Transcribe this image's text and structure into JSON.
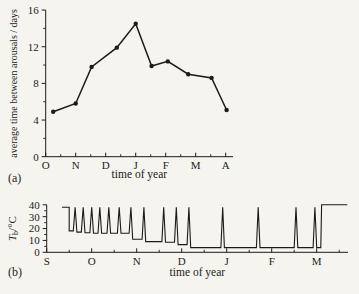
{
  "colors": {
    "ink": "#1b1b1b",
    "background": "#f6f4ef"
  },
  "panels": {
    "a": {
      "label": "(a)"
    },
    "b": {
      "label": "(b)"
    }
  },
  "chart_data": [
    {
      "panel": "a",
      "type": "line",
      "title": "",
      "xlabel": "time of year",
      "ylabel": "average time between arousals / days",
      "x_tick_labels": [
        "O",
        "N",
        "D",
        "J",
        "F",
        "M",
        "A"
      ],
      "y_major_ticks": [
        0,
        4,
        8,
        12,
        16
      ],
      "y_minor_ticks": [
        2,
        6,
        10,
        14
      ],
      "ylim": [
        0,
        16
      ],
      "grid": false,
      "legend": "none",
      "marker": "filled-circle",
      "series": [
        {
          "name": "average time between arousals",
          "x": [
            0.25,
            1.0,
            1.53,
            2.37,
            3.0,
            3.53,
            4.07,
            4.75,
            5.53,
            6.03
          ],
          "y": [
            4.9,
            5.8,
            9.8,
            11.9,
            14.5,
            9.9,
            10.4,
            9.0,
            8.6,
            5.1
          ]
        }
      ]
    },
    {
      "panel": "b",
      "type": "line",
      "title": "",
      "xlabel": "time of year",
      "ylabel": "Tb/°C",
      "ylabel_parts": {
        "lead": "T",
        "sub": "b",
        "rest": "/°C"
      },
      "x_tick_labels": [
        "S",
        "O",
        "N",
        "D",
        "J",
        "F",
        "M"
      ],
      "y_major_ticks": [
        0,
        10,
        20,
        30,
        40
      ],
      "y_minor_ticks": [
        5,
        15,
        25,
        35
      ],
      "ylim": [
        0,
        40
      ],
      "grid": false,
      "legend": "none",
      "marker": "none",
      "series": [
        {
          "name": "body temperature (Tb)",
          "x": [
            0.34,
            0.5,
            0.5,
            0.59,
            0.63,
            0.67,
            0.77,
            0.81,
            0.85,
            0.96,
            1.0,
            1.04,
            1.14,
            1.18,
            1.22,
            1.34,
            1.38,
            1.42,
            1.57,
            1.61,
            1.65,
            1.83,
            1.87,
            1.91,
            2.12,
            2.16,
            2.2,
            2.56,
            2.6,
            2.64,
            2.84,
            2.88,
            2.92,
            3.12,
            3.16,
            3.2,
            3.87,
            3.91,
            3.95,
            4.66,
            4.7,
            4.74,
            5.5,
            5.54,
            5.58,
            5.92,
            5.96,
            6.0,
            6.09,
            6.11,
            6.68
          ],
          "y": [
            38,
            38,
            18,
            18,
            38,
            17,
            17,
            38,
            16.5,
            16.5,
            38,
            16,
            16,
            38,
            16,
            16,
            38,
            16,
            16,
            38,
            16,
            16,
            38,
            11,
            11,
            38,
            9,
            9,
            38,
            8.5,
            8.5,
            38,
            6.5,
            6.5,
            38,
            4,
            4,
            38,
            4,
            4,
            38,
            4,
            4,
            38,
            4,
            4,
            38,
            4,
            4,
            40,
            40
          ]
        }
      ]
    }
  ]
}
